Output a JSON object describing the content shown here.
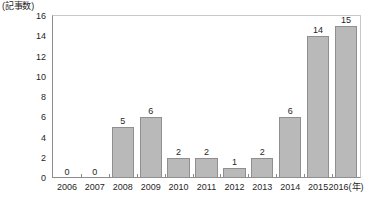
{
  "chart_data": {
    "type": "bar",
    "title": "",
    "unit_caption": "(記事数)",
    "xlabel": "",
    "xlabel_unit": "(年)",
    "ylabel": "(記事数)",
    "ylim": [
      0,
      16
    ],
    "ytick_step": 2,
    "yticks": [
      0,
      2,
      4,
      6,
      8,
      10,
      12,
      14,
      16
    ],
    "ytick_labels": [
      "0",
      "2",
      "4",
      "6",
      "8",
      "10",
      "12",
      "14",
      "16"
    ],
    "categories": [
      "2006",
      "2007",
      "2008",
      "2009",
      "2010",
      "2011",
      "2012",
      "2013",
      "2014",
      "2015",
      "2016"
    ],
    "values": [
      0,
      0,
      5,
      6,
      2,
      2,
      1,
      2,
      6,
      14,
      15
    ],
    "value_labels": [
      "0",
      "0",
      "5",
      "6",
      "2",
      "2",
      "1",
      "2",
      "6",
      "14",
      "15"
    ],
    "grid": false,
    "legend": null,
    "colors": {
      "bar_fill": "#b9b9b9",
      "bar_stroke": "#8f8f8f",
      "axis": "#8d8d8d",
      "frame_light": "#c9c9c9",
      "text": "#1f1f1f",
      "background": "#ffffff"
    }
  }
}
